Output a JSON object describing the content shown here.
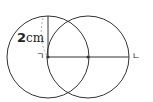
{
  "diagram": {
    "labels": {
      "radius_value": "2",
      "radius_unit": "cm",
      "point_left": "ㄱ",
      "point_right": "ㄴ"
    },
    "colors": {
      "stroke": "#333333",
      "dashed": "#999999"
    }
  }
}
